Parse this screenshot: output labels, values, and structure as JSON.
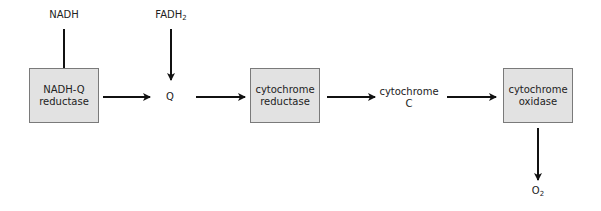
{
  "diagram": {
    "inputs": {
      "nadh": "NADH",
      "fadh2_base": "FADH",
      "fadh2_sub": "2"
    },
    "boxes": [
      {
        "line1": "NADH-Q",
        "line2": "reductase"
      },
      {
        "line1": "cytochrome",
        "line2": "reductase"
      },
      {
        "line1": "cytochrome",
        "line2": "oxidase"
      }
    ],
    "carriers": {
      "q": "Q",
      "cyt_c_line1": "cytochrome",
      "cyt_c_line2": "C"
    },
    "output": {
      "o2_base": "O",
      "o2_sub": "2"
    },
    "colors": {
      "box_fill": "#e2e2e2",
      "box_border": "#7a7a7a",
      "arrow": "#111111"
    }
  }
}
